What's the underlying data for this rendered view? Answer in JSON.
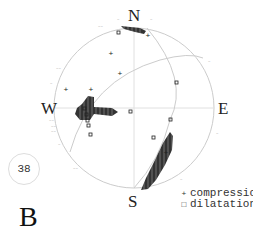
{
  "figure": {
    "panel_label": "B",
    "event_id": "38",
    "cardinal": {
      "north": "N",
      "south": "S",
      "west": "W",
      "east": "E"
    },
    "legend": [
      {
        "symbol": "+",
        "label": "compression"
      },
      {
        "symbol": "□",
        "label": "dilatation"
      }
    ],
    "colors": {
      "circle": "#cccccc",
      "nodal_plane": "#cccccc",
      "axes": "#dddddd",
      "shading": "#333333",
      "markers": "#222222"
    }
  }
}
